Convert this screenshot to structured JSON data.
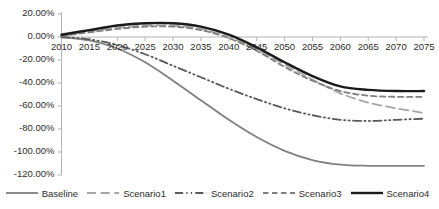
{
  "chart_data": {
    "type": "line",
    "title": "",
    "xlabel": "",
    "ylabel": "",
    "grid": false,
    "legend_position": "bottom",
    "x": [
      2010,
      2015,
      2020,
      2025,
      2030,
      2035,
      2040,
      2045,
      2050,
      2055,
      2060,
      2065,
      2070,
      2075
    ],
    "xlim": [
      2010,
      2075
    ],
    "ylim": [
      -120,
      20
    ],
    "yticks": [
      20,
      0,
      -20,
      -40,
      -60,
      -80,
      -100,
      -120
    ],
    "ytick_labels": [
      "20.00%",
      "0.00%",
      "-20.00%",
      "-40.00%",
      "-60.00%",
      "-80.00%",
      "-100.00%",
      "-120.00%"
    ],
    "xtick_labels": [
      "2010",
      "2015",
      "2020",
      "2025",
      "2030",
      "2035",
      "2040",
      "2045",
      "2050",
      "2055",
      "2060",
      "2065",
      "2070",
      "2075"
    ],
    "series": [
      {
        "name": "Baseline",
        "color": "#808080",
        "style": "solid",
        "width": 1.8,
        "values": [
          0,
          -3,
          -10,
          -22,
          -38,
          -55,
          -72,
          -87,
          -99,
          -107,
          -111,
          -112,
          -112,
          -112
        ]
      },
      {
        "name": "Scenario1",
        "color": "#a6a6a6",
        "style": "dashed-long",
        "width": 1.8,
        "values": [
          1,
          5,
          8,
          10,
          10,
          7,
          0,
          -11,
          -24,
          -37,
          -49,
          -57,
          -62,
          -66
        ]
      },
      {
        "name": "Scenario2",
        "color": "#595959",
        "style": "dash-dot-dot",
        "width": 1.8,
        "values": [
          0,
          -2,
          -7,
          -15,
          -25,
          -35,
          -45,
          -54,
          -62,
          -68,
          -72,
          -73,
          -72,
          -71
        ]
      },
      {
        "name": "Scenario3",
        "color": "#7f7f7f",
        "style": "dashed",
        "width": 1.8,
        "values": [
          1,
          4,
          7,
          9,
          9,
          6,
          -1,
          -12,
          -26,
          -38,
          -47,
          -51,
          -52,
          -52
        ]
      },
      {
        "name": "Scenario4",
        "color": "#1a1a1a",
        "style": "solid",
        "width": 2.4,
        "values": [
          2,
          6,
          10,
          12,
          12,
          9,
          2,
          -9,
          -22,
          -34,
          -43,
          -46,
          -47,
          -47
        ]
      }
    ]
  },
  "legend": {
    "items": [
      {
        "label": "Baseline"
      },
      {
        "label": "Scenario1"
      },
      {
        "label": "Scenario2"
      },
      {
        "label": "Scenario3"
      },
      {
        "label": "Scenario4"
      }
    ]
  },
  "axis": {
    "line_color": "#b3b3b3"
  }
}
